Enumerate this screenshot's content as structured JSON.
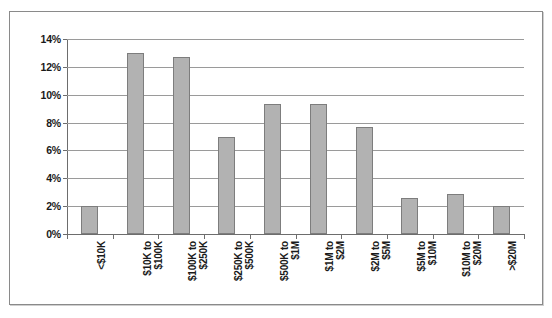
{
  "chart_data": {
    "type": "bar",
    "title": "",
    "subtitle": "",
    "xlabel": "",
    "ylabel": "",
    "grid": true,
    "legend": false,
    "ylim": [
      0,
      14
    ],
    "y_tick_labels": [
      "14%",
      "12%",
      "10%",
      "8%",
      "6%",
      "4%",
      "2%",
      "0%"
    ],
    "y_ticks": [
      14,
      12,
      10,
      8,
      6,
      4,
      2,
      0
    ],
    "categories": [
      "<$10K",
      "$10K to $100K",
      "$100K to $250K",
      "$250K to $500K",
      "$500K to $1M",
      "$1M to $2M",
      "$2M to $5M",
      "$5M to $10M",
      "$10M to $20M",
      ">$20M"
    ],
    "category_lines": [
      [
        "<$10K",
        ""
      ],
      [
        "$10K to",
        "$100K"
      ],
      [
        "$100K to",
        "$250K"
      ],
      [
        "$250K to",
        "$500K"
      ],
      [
        "$500K to",
        "$1M"
      ],
      [
        "$1M to",
        "$2M"
      ],
      [
        "$2M to",
        "$5M"
      ],
      [
        "$5M to",
        "$10M"
      ],
      [
        "$10M to",
        "$20M"
      ],
      [
        ">$20M",
        ""
      ]
    ],
    "values": [
      2.0,
      13.0,
      12.7,
      7.0,
      9.3,
      9.3,
      7.7,
      2.6,
      2.9,
      2.0
    ],
    "bar_color": "#b2b2b2",
    "bar_border_color": "#7d7d7d",
    "grid_color": "#9a9a9a",
    "axis_color": "#6d6d6d"
  }
}
